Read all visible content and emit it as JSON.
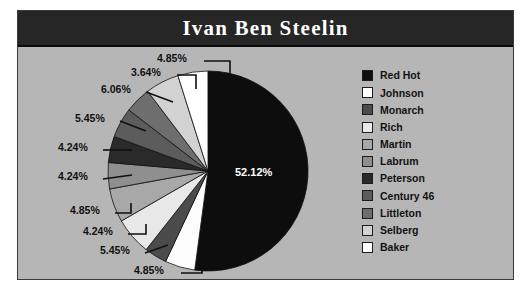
{
  "chart": {
    "title": "Ivan Ben Steelin"
  },
  "colors": {
    "page_background": "#ffffff",
    "plot_background": "#b6b6b6",
    "title_banner": "#262626",
    "title_text": "#ffffff",
    "border": "#3a3a3a",
    "label_text": "#101010",
    "center_label_text": "#ffffff"
  },
  "legend": {
    "items": [
      {
        "label": "Red Hot",
        "color": "#0d0d0d"
      },
      {
        "label": "Johnson",
        "color": "#fdfdfd"
      },
      {
        "label": "Monarch",
        "color": "#4b4b4b"
      },
      {
        "label": "Rich",
        "color": "#e8e8e8"
      },
      {
        "label": "Martin",
        "color": "#a8a8a8"
      },
      {
        "label": "Labrum",
        "color": "#8f8f8f"
      },
      {
        "label": "Peterson",
        "color": "#2a2a2a"
      },
      {
        "label": "Century 46",
        "color": "#5c5c5c"
      },
      {
        "label": "Littleton",
        "color": "#6e6e6e"
      },
      {
        "label": "Selberg",
        "color": "#d2d2d2"
      },
      {
        "label": "Baker",
        "color": "#ffffff"
      }
    ]
  },
  "chart_data": {
    "type": "pie",
    "title": "Ivan Ben Steelin",
    "legend_position": "right",
    "labels_as_percent": true,
    "total_percent": 100.0,
    "categories": [
      "Red Hot",
      "Johnson",
      "Monarch",
      "Rich",
      "Martin",
      "Labrum",
      "Peterson",
      "Century 46",
      "Littleton",
      "Selberg",
      "Baker"
    ],
    "values": [
      52.12,
      4.85,
      3.64,
      6.06,
      5.45,
      4.24,
      4.24,
      4.85,
      4.24,
      5.45,
      4.85
    ],
    "value_labels": [
      "52.12%",
      "4.85%",
      "3.64%",
      "6.06%",
      "5.45%",
      "4.24%",
      "4.24%",
      "4.85%",
      "4.24%",
      "5.45%",
      "4.85%"
    ],
    "slice_colors": [
      "#0d0d0d",
      "#fdfdfd",
      "#4b4b4b",
      "#e8e8e8",
      "#a8a8a8",
      "#8f8f8f",
      "#2a2a2a",
      "#5c5c5c",
      "#6e6e6e",
      "#d2d2d2",
      "#ffffff"
    ],
    "start_angle_deg": 0,
    "direction": "clockwise",
    "center_slice_label": "52.12%"
  },
  "callouts": {
    "l1": "4.85%",
    "l2": "3.64%",
    "l3": "6.06%",
    "l4": "5.45%",
    "l5": "4.24%",
    "l6": "4.24%",
    "l7": "4.85%",
    "l8": "4.24%",
    "l9": "5.45%",
    "l10": "4.85%",
    "center": "52.12%"
  }
}
